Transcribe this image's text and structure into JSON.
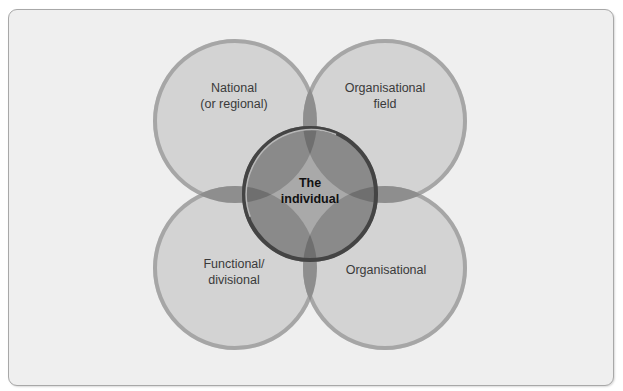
{
  "diagram": {
    "type": "venn",
    "circles": [
      {
        "id": "national",
        "line1": "National",
        "line2": "(or regional)",
        "cx": 235,
        "cy": 121,
        "r": 82
      },
      {
        "id": "organisational-field",
        "line1": "Organisational",
        "line2": "field",
        "cx": 385,
        "cy": 121,
        "r": 82
      },
      {
        "id": "functional",
        "line1": "Functional/",
        "line2": "divisional",
        "cx": 235,
        "cy": 268,
        "r": 82
      },
      {
        "id": "organisational",
        "line1": "Organisational",
        "line2": "",
        "cx": 385,
        "cy": 268,
        "r": 82
      }
    ],
    "center": {
      "id": "individual",
      "line1": "The",
      "line2": "individual",
      "cx": 310,
      "cy": 194,
      "r": 68
    },
    "colors": {
      "background": "#efefef",
      "frame_border": "#a8a8a8",
      "circle_fill": "#d3d3d3",
      "circle_rim": "#9e9e9e",
      "overlap_fill": "#8c8c8c",
      "center_fill": "#9a9a9a",
      "center_rim": "#3e3e3e"
    }
  }
}
